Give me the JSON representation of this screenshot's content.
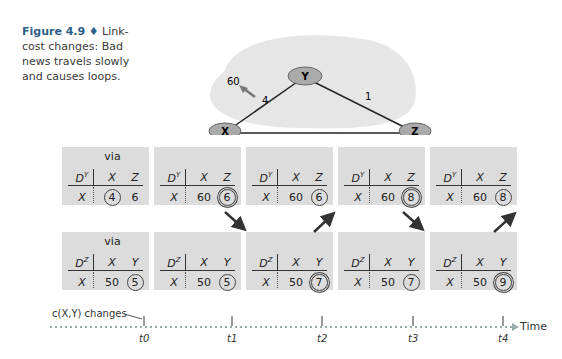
{
  "caption": {
    "figure": "Figure 4.9",
    "separator": "♦",
    "text": "Link-cost changes: Bad news travels slowly and causes loops."
  },
  "network": {
    "nodes": [
      "X",
      "Y",
      "Z"
    ],
    "links": [
      {
        "from": "X",
        "to": "Y",
        "cost": "4",
        "new_cost": "60"
      },
      {
        "from": "Y",
        "to": "Z",
        "cost": "1"
      },
      {
        "from": "X",
        "to": "Z",
        "cost": "50"
      }
    ]
  },
  "via_label": "via",
  "tables_y": [
    {
      "label": "D",
      "sup": "Y",
      "cols": [
        "X",
        "Z"
      ],
      "row": "X",
      "vals": [
        "4",
        "6"
      ],
      "circled": 0,
      "double": false,
      "via": true
    },
    {
      "label": "D",
      "sup": "Y",
      "cols": [
        "X",
        "Z"
      ],
      "row": "X",
      "vals": [
        "60",
        "6"
      ],
      "circled": 1,
      "double": true
    },
    {
      "label": "D",
      "sup": "Y",
      "cols": [
        "X",
        "Z"
      ],
      "row": "X",
      "vals": [
        "60",
        "6"
      ],
      "circled": 1,
      "double": false
    },
    {
      "label": "D",
      "sup": "Y",
      "cols": [
        "X",
        "Z"
      ],
      "row": "X",
      "vals": [
        "60",
        "8"
      ],
      "circled": 1,
      "double": true
    },
    {
      "label": "D",
      "sup": "Y",
      "cols": [
        "X",
        "Z"
      ],
      "row": "X",
      "vals": [
        "60",
        "8"
      ],
      "circled": 1,
      "double": false
    }
  ],
  "tables_z": [
    {
      "label": "D",
      "sup": "Z",
      "cols": [
        "X",
        "Y"
      ],
      "row": "X",
      "vals": [
        "50",
        "5"
      ],
      "circled": 1,
      "double": false,
      "via": true
    },
    {
      "label": "D",
      "sup": "Z",
      "cols": [
        "X",
        "Y"
      ],
      "row": "X",
      "vals": [
        "50",
        "5"
      ],
      "circled": 1,
      "double": false
    },
    {
      "label": "D",
      "sup": "Z",
      "cols": [
        "X",
        "Y"
      ],
      "row": "X",
      "vals": [
        "50",
        "7"
      ],
      "circled": 1,
      "double": true
    },
    {
      "label": "D",
      "sup": "Z",
      "cols": [
        "X",
        "Y"
      ],
      "row": "X",
      "vals": [
        "50",
        "7"
      ],
      "circled": 1,
      "double": false
    },
    {
      "label": "D",
      "sup": "Z",
      "cols": [
        "X",
        "Y"
      ],
      "row": "X",
      "vals": [
        "50",
        "9"
      ],
      "circled": 1,
      "double": true
    }
  ],
  "timeline": {
    "event": "c(X,Y) changes",
    "ticks": [
      "t0",
      "t1",
      "t2",
      "t3",
      "t4"
    ],
    "axis_label": "Time"
  },
  "colors": {
    "caption_accent": "#2b5f8a",
    "table_bg": "#dcdcdc",
    "cloud_bg": "#e6e6e6",
    "arrow": "#333333"
  }
}
